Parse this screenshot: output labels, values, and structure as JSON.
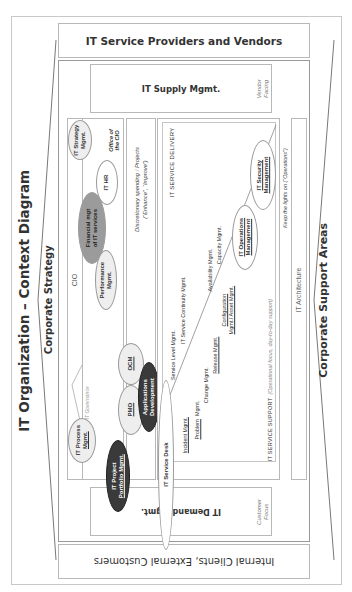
{
  "title": "IT Organization – Context Diagram",
  "bands": {
    "corporate_strategy": "Corporate Strategy",
    "corporate_support": "Corporate Support Areas",
    "providers": "IT Service Providers and Vendors",
    "clients": "Internal Clients, External Customers"
  },
  "supply": {
    "label": "IT Supply Mgmt.",
    "facing_line1": "Vendor",
    "facing_line2": "Facing"
  },
  "demand": {
    "label": "IT Demand Mgmt.",
    "facing_line1": "Customer",
    "facing_line2": "Focus"
  },
  "cio": {
    "label": "CIO",
    "office_line1": "Office of",
    "office_line2": "the CIO",
    "governance": "IT Governance",
    "ellipses": {
      "strategy": [
        "IT Strategy",
        "Mgmt."
      ],
      "hr": [
        "IT HR"
      ],
      "financial": [
        "Financial mgt",
        "of IT services"
      ],
      "performance": [
        "Performance",
        "Mgmt."
      ],
      "process": [
        "IT Process",
        "Mgmt."
      ]
    }
  },
  "discretionary": {
    "line1": "Discretionary spending / Projects",
    "line2": "(“Enhance”, “Improve”)"
  },
  "projects": {
    "portfolio": [
      "IT Project",
      "Portfolio Mgmt."
    ],
    "pmo": [
      "PMO"
    ],
    "ocm": [
      "OCM"
    ],
    "appdev": [
      "Applications",
      "Development"
    ]
  },
  "services": {
    "delivery_label": "IT SERVICE DELIVERY",
    "support_label": "IT SERVICE SUPPORT",
    "support_note": "(Operational focus, day-to-day support)",
    "service_desk": "IT Service Desk",
    "items": {
      "incident": "Incident Mgmt.",
      "problem": "Problem",
      "problem_mgmt": "Mgmt.",
      "change": "Change Mgmt.",
      "release": "Release Mgmt.",
      "config1": "Configuration",
      "config2": "Mgmt./ Asset Mgmt.",
      "service_level": "Service Level Mgmt.",
      "continuity": "IT Service Continuity Mgmt.",
      "availability": "Availability Mgmt.",
      "capacity": "Capacity Mgmt."
    },
    "operations": [
      "IT Operations",
      "Management"
    ],
    "security": [
      "IT Security",
      "Management"
    ]
  },
  "keep_lights": "Keep the lights on (“Operations”)",
  "architecture": "IT Architecture",
  "colors": {
    "line": "#b8b8b8",
    "dark": "#3a3a3a",
    "mid": "#9b9b9b",
    "light": "#eeeeee"
  }
}
